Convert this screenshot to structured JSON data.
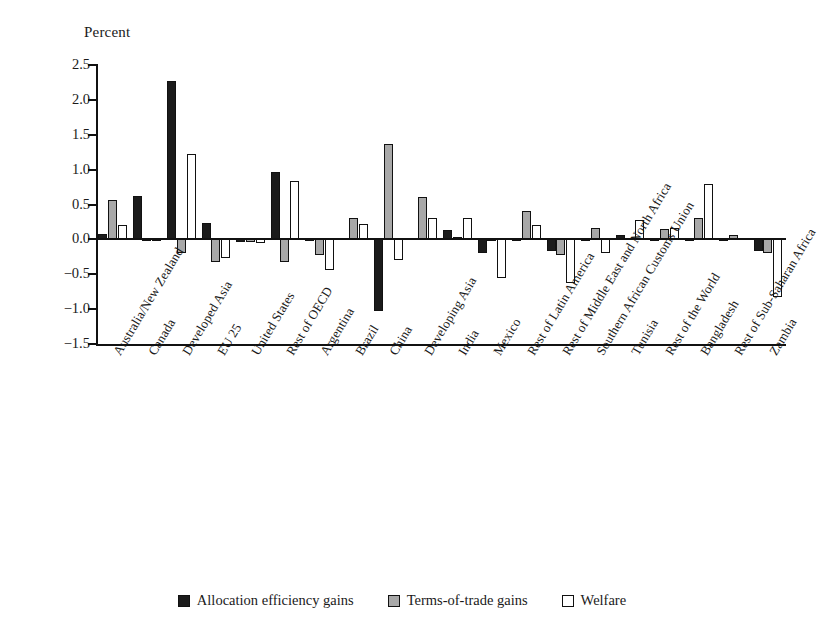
{
  "chart_data": {
    "type": "bar",
    "title": "",
    "subtitle": "",
    "xlabel": "",
    "ylabel": "Percent",
    "ylim": [
      -1.5,
      2.5
    ],
    "yticks": [
      2.5,
      2.0,
      1.5,
      1.0,
      0.5,
      0.0,
      -0.5,
      -1.0,
      -1.5
    ],
    "ytick_labels": [
      "2.5",
      "2.0",
      "1.5",
      "1.0",
      "0.5",
      "0.0",
      "-0.5",
      "-1.0",
      "-1.5"
    ],
    "grid": false,
    "legend_position": "bottom",
    "categories": [
      "Australia/New Zealand",
      "Canada",
      "Developed Asia",
      "EU 25",
      "United States",
      "Rest of OECD",
      "Argentina",
      "Brazil",
      "China",
      "Developing Asia",
      "India",
      "Mexico",
      "Rest of Latin America",
      "Rest of Middle East and North Africa",
      "Southern African Customs Union",
      "Tunisia",
      "Rest of the World",
      "Bangladesh",
      "Rest of Sub-Saharan Africa",
      "Zambia"
    ],
    "series": [
      {
        "name": "Allocation efficiency gains",
        "color": "#1b1b1b",
        "values": [
          0.08,
          0.62,
          2.27,
          0.23,
          -0.04,
          0.97,
          -0.02,
          0.02,
          -1.03,
          0.02,
          0.14,
          -0.19,
          0.01,
          -0.17,
          0.01,
          0.06,
          0.01,
          -0.03,
          0.0,
          -0.17
        ]
      },
      {
        "name": "Terms-of-trade gains",
        "color": "#a8a8a8",
        "values": [
          0.57,
          -0.02,
          -0.2,
          -0.33,
          -0.04,
          -0.33,
          -0.22,
          0.3,
          1.37,
          0.61,
          0.03,
          0.01,
          0.41,
          -0.22,
          0.17,
          0.02,
          0.15,
          0.31,
          0.06,
          -0.2
        ]
      },
      {
        "name": "Welfare",
        "color": "#ffffff",
        "values": [
          0.2,
          -0.02,
          1.23,
          -0.27,
          -0.05,
          0.83,
          -0.44,
          0.22,
          -0.3,
          0.3,
          0.3,
          -0.55,
          0.21,
          -0.63,
          -0.2,
          0.28,
          0.17,
          0.79,
          0.02,
          -0.82
        ]
      }
    ]
  },
  "legend": {
    "items": [
      {
        "label": "Allocation efficiency gains",
        "swatch": "filled-black-swatch"
      },
      {
        "label": "Terms-of-trade gains",
        "swatch": "filled-gray-swatch"
      },
      {
        "label": "Welfare",
        "swatch": "outline-white-swatch"
      }
    ]
  }
}
